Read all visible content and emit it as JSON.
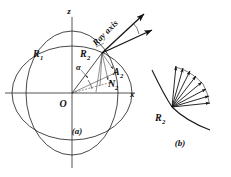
{
  "figure": {
    "kind": "optics-ray-geometry-diagram",
    "background_color": "#ffffff",
    "ink_color": "#111111",
    "panels": [
      {
        "id": "a",
        "caption": "(a)"
      },
      {
        "id": "b",
        "caption": "(b)"
      }
    ],
    "panel_a": {
      "caption": "(a)",
      "axes": {
        "vertical_label": "z",
        "horizontal_label": "x",
        "origin_label": "O"
      },
      "points": [
        {
          "name": "R1",
          "base": "R",
          "sub": "1"
        },
        {
          "name": "R2",
          "base": "R",
          "sub": "2"
        }
      ],
      "vectors": [
        {
          "name": "A2",
          "base": "A",
          "sub": "2"
        },
        {
          "name": "N2",
          "base": "N",
          "sub": "2"
        }
      ],
      "angles": [
        {
          "name": "alpha",
          "glyph": "α"
        }
      ],
      "ray_axis_label": "Ray axis",
      "surfaces": [
        {
          "name": "outer-wave-surface",
          "rx": 52,
          "ry": 68
        },
        {
          "name": "inner-wave-surface",
          "rx": 66,
          "ry": 52
        }
      ]
    },
    "panel_b": {
      "caption": "(b)",
      "points": [
        {
          "name": "R2",
          "base": "R",
          "sub": "2"
        }
      ],
      "fan_ray_count": 8,
      "description": "fan of rays from R2 on a curved wave surface"
    }
  }
}
